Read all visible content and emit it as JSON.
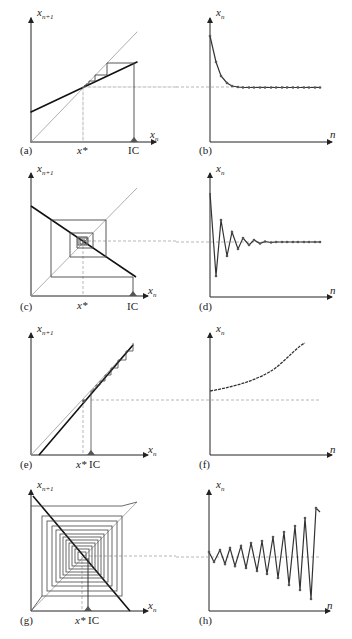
{
  "figure": {
    "panels": [
      {
        "id": "a",
        "caption": "(a)",
        "type": "cobweb",
        "ylabel": "x_{n+1}",
        "xlabel": "x_n",
        "ticks": [
          "x*",
          "IC"
        ],
        "behavior": "monotone convergence"
      },
      {
        "id": "b",
        "caption": "(b)",
        "type": "time-series",
        "ylabel": "x_n",
        "xlabel": "n",
        "behavior": "monotone convergence to x*"
      },
      {
        "id": "c",
        "caption": "(c)",
        "type": "cobweb",
        "ylabel": "x_{n+1}",
        "xlabel": "x_n",
        "ticks": [
          "x*",
          "IC"
        ],
        "behavior": "oscillatory convergence"
      },
      {
        "id": "d",
        "caption": "(d)",
        "type": "time-series",
        "ylabel": "x_n",
        "xlabel": "n",
        "behavior": "damped oscillation to x*"
      },
      {
        "id": "e",
        "caption": "(e)",
        "type": "cobweb",
        "ylabel": "x_{n+1}",
        "xlabel": "x_n",
        "ticks": [
          "x*",
          "IC"
        ],
        "behavior": "monotone divergence"
      },
      {
        "id": "f",
        "caption": "(f)",
        "type": "time-series",
        "ylabel": "x_n",
        "xlabel": "n",
        "behavior": "monotone divergence from x*"
      },
      {
        "id": "g",
        "caption": "(g)",
        "type": "cobweb",
        "ylabel": "x_{n+1}",
        "xlabel": "x_n",
        "ticks": [
          "x*",
          "IC"
        ],
        "behavior": "oscillatory divergence"
      },
      {
        "id": "h",
        "caption": "(h)",
        "type": "time-series",
        "ylabel": "x_n",
        "xlabel": "n",
        "behavior": "growing oscillation around x*"
      }
    ],
    "labels": {
      "x": "x",
      "n_plus_1": "n+1",
      "n_sub": "n",
      "n": "n",
      "xstar": "x*",
      "ic": "IC",
      "cap_a": "(a)",
      "cap_b": "(b)",
      "cap_c": "(c)",
      "cap_d": "(d)",
      "cap_e": "(e)",
      "cap_f": "(f)",
      "cap_g": "(g)",
      "cap_h": "(h)"
    },
    "colors": {
      "axis": "#222222",
      "map": "#1a1a1a",
      "diagonal": "#888888",
      "dashed": "#888888",
      "ic_marker": "#555555"
    }
  }
}
